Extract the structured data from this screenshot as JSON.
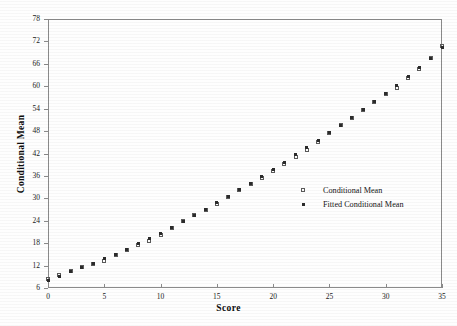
{
  "chart_data": {
    "type": "scatter",
    "title": "",
    "xlabel": "Score",
    "ylabel": "Conditional Mean",
    "xlim": [
      0,
      35
    ],
    "ylim": [
      6,
      78
    ],
    "xticks": [
      0,
      5,
      10,
      15,
      20,
      25,
      30,
      35
    ],
    "yticks": [
      6,
      12,
      18,
      24,
      30,
      36,
      42,
      48,
      54,
      60,
      66,
      72,
      78
    ],
    "grid": false,
    "legend_position": "center-right-inside",
    "legend": [
      "Conditional Mean",
      "Fitted Conditional Mean"
    ],
    "colors": {
      "conditional_mean_marker": "#5a5a5a",
      "fitted_conditional_mean_marker": "#2b2b2b",
      "axis": "#8a8a8a",
      "text": "#141414",
      "background": "#fefefe"
    },
    "x": [
      0,
      1,
      2,
      3,
      4,
      5,
      6,
      7,
      8,
      9,
      10,
      11,
      12,
      13,
      14,
      15,
      16,
      17,
      18,
      19,
      20,
      21,
      22,
      23,
      24,
      25,
      26,
      27,
      28,
      29,
      30,
      31,
      32,
      33,
      34,
      35
    ],
    "series": [
      {
        "name": "Conditional Mean",
        "marker": "open-square",
        "values": [
          8.3,
          9.4,
          10.6,
          11.6,
          12.4,
          13.3,
          14.7,
          16.3,
          17.6,
          18.6,
          20.1,
          22.0,
          23.9,
          25.6,
          27.0,
          28.6,
          30.3,
          32.1,
          33.8,
          35.5,
          37.3,
          39.2,
          41.1,
          42.9,
          45.2,
          47.5,
          49.6,
          51.4,
          53.6,
          55.7,
          57.8,
          59.6,
          62.2,
          64.6,
          67.6,
          70.8
        ]
      },
      {
        "name": "Fitted Conditional Mean",
        "marker": "filled-square",
        "values": [
          8.0,
          9.2,
          10.4,
          11.5,
          12.6,
          13.8,
          15.1,
          16.4,
          17.8,
          19.2,
          20.7,
          22.2,
          23.8,
          25.4,
          27.1,
          28.8,
          30.5,
          32.3,
          34.1,
          35.9,
          37.8,
          39.7,
          41.6,
          43.5,
          45.5,
          47.5,
          49.5,
          51.6,
          53.7,
          55.8,
          58.0,
          60.2,
          62.5,
          64.9,
          67.5,
          70.4
        ]
      }
    ]
  }
}
